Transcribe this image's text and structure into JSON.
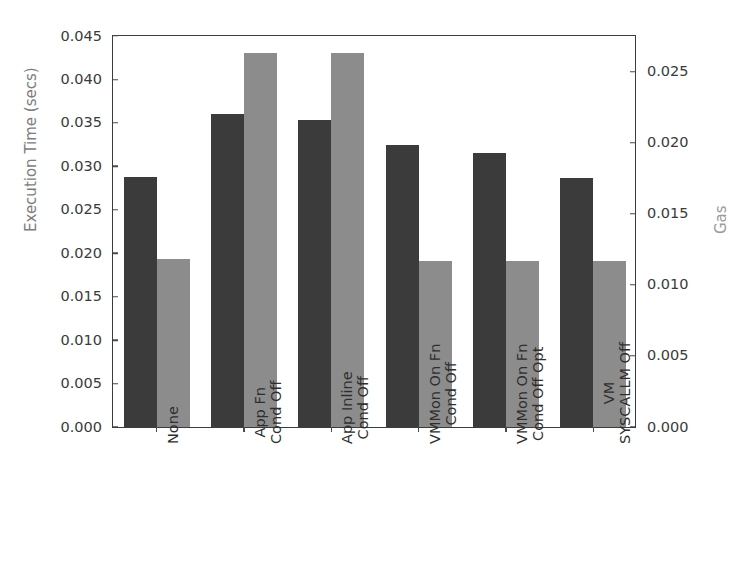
{
  "chart_data": {
    "type": "bar",
    "title": "",
    "xlabel": "",
    "ylabel": "Execution Time (secs)",
    "y2label": "Gas",
    "grid": false,
    "legend": "none",
    "categories": [
      "None",
      "App Fn\nCond Off",
      "App Inline\nCond Off",
      "VMMon On Fn\nCond Off",
      "VMMon On Fn\nCond Off Opt",
      "VM\nSYSCALLM Off"
    ],
    "category_lines": [
      [
        "None",
        ""
      ],
      [
        "App Fn",
        "Cond Off"
      ],
      [
        "App Inline",
        "Cond Off"
      ],
      [
        "VMMon On Fn",
        "Cond Off"
      ],
      [
        "VMMon On Fn",
        "Cond Off Opt"
      ],
      [
        "VM",
        "SYSCALLM Off"
      ]
    ],
    "series": [
      {
        "name": "Execution Time (secs)",
        "axis": "left",
        "color": "#3b3b3b",
        "values": [
          0.0288,
          0.036,
          0.0353,
          0.0325,
          0.0315,
          0.0287
        ]
      },
      {
        "name": "Gas",
        "axis": "right",
        "color": "#8c8c8c",
        "values": [
          0.0118,
          0.0263,
          0.0263,
          0.0117,
          0.0117,
          0.0117
        ]
      }
    ],
    "ylim": [
      0.0,
      0.045
    ],
    "y2lim": [
      0.0,
      0.02752
    ],
    "yticks": [
      "0.000",
      "0.005",
      "0.010",
      "0.015",
      "0.020",
      "0.025",
      "0.030",
      "0.035",
      "0.040",
      "0.045"
    ],
    "ytick_values": [
      0.0,
      0.005,
      0.01,
      0.015,
      0.02,
      0.025,
      0.03,
      0.035,
      0.04,
      0.045
    ],
    "y2ticks": [
      "0.000",
      "0.005",
      "0.010",
      "0.015",
      "0.020",
      "0.025"
    ],
    "y2tick_values": [
      0.0,
      0.005,
      0.01,
      0.015,
      0.02,
      0.025
    ]
  },
  "style": {
    "bar_exec_color": "#3b3b3b",
    "bar_gas_color": "#8c8c8c",
    "axis_color": "#3c3c3c",
    "tick_text_color": "#3a3a3a",
    "ylabel_left_color": "#7d7d7d",
    "ylabel_right_color": "#9a9a9a",
    "background": "#ffffff"
  }
}
